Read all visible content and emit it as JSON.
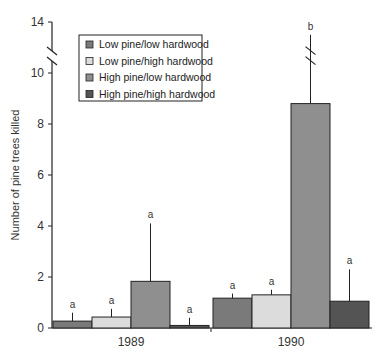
{
  "chart_data": {
    "type": "bar",
    "title": "",
    "xlabel": "",
    "ylabel": "Number of pine trees killed",
    "ylim": [
      0,
      14
    ],
    "axis_break": {
      "from": 10,
      "to": 14,
      "note": "y-axis broken between ~10 and 14"
    },
    "yticks": [
      0,
      2,
      4,
      6,
      8,
      10,
      14
    ],
    "categories": [
      "1989",
      "1990"
    ],
    "legend_position": "upper-left inside",
    "series": [
      {
        "name": "Low pine/low hardwood",
        "color": "#7a7a7a",
        "values": [
          0.27,
          1.17
        ],
        "error_upper": [
          0.6,
          1.35
        ],
        "letters": [
          "a",
          "a"
        ]
      },
      {
        "name": "Low pine/high hardwood",
        "color": "#dcdcdc",
        "values": [
          0.43,
          1.3
        ],
        "error_upper": [
          0.75,
          1.5
        ],
        "letters": [
          "a",
          "a"
        ]
      },
      {
        "name": "High pine/low hardwood",
        "color": "#8f8f8f",
        "values": [
          1.83,
          8.8
        ],
        "error_upper": [
          4.1,
          13.0
        ],
        "letters": [
          "a",
          "b"
        ]
      },
      {
        "name": "High pine/high hardwood",
        "color": "#545454",
        "values": [
          0.1,
          1.05
        ],
        "error_upper": [
          0.4,
          2.3
        ],
        "letters": [
          "a",
          "a"
        ]
      }
    ]
  },
  "legend": {
    "items": [
      {
        "label": "Low pine/low hardwood",
        "color": "#7a7a7a"
      },
      {
        "label": "Low pine/high hardwood",
        "color": "#dcdcdc"
      },
      {
        "label": "High pine/low hardwood",
        "color": "#8f8f8f"
      },
      {
        "label": "High pine/high hardwood",
        "color": "#545454"
      }
    ]
  }
}
